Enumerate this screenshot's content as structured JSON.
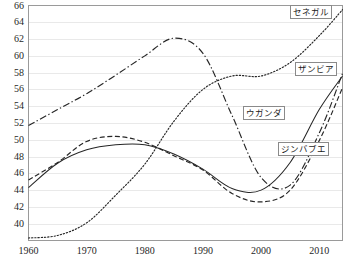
{
  "chart_data": {
    "type": "line",
    "title": "",
    "xlabel": "",
    "ylabel": "",
    "xlim": [
      1960,
      2014
    ],
    "ylim": [
      38,
      66
    ],
    "grid": true,
    "legend_position": "inline-labels",
    "xticks": [
      "1960",
      "1970",
      "1980",
      "1990",
      "2000",
      "2010"
    ],
    "xtick_values": [
      1960,
      1970,
      1980,
      1990,
      2000,
      2010
    ],
    "yticks": [
      "40",
      "42",
      "44",
      "46",
      "48",
      "50",
      "52",
      "54",
      "56",
      "58",
      "60",
      "62",
      "64",
      "66"
    ],
    "ytick_values": [
      40,
      42,
      44,
      46,
      48,
      50,
      52,
      54,
      56,
      58,
      60,
      62,
      64,
      66
    ],
    "x": [
      1960,
      1965,
      1970,
      1975,
      1980,
      1985,
      1990,
      1995,
      2000,
      2005,
      2010,
      2014
    ],
    "series": [
      {
        "name": "セネガル",
        "style": "dotted",
        "values": [
          38.3,
          38.6,
          40.1,
          43.4,
          47.1,
          52.2,
          56.0,
          57.6,
          57.6,
          59.2,
          62.4,
          65.5
        ],
        "label_x": 2008,
        "label_y": 65.3
      },
      {
        "name": "ザンビア",
        "style": "dash-dot",
        "values": [
          51.7,
          53.6,
          55.5,
          57.7,
          60.0,
          62.1,
          60.3,
          52.9,
          45.5,
          44.6,
          50.8,
          57.9
        ],
        "label_x": 2009,
        "label_y": 58.6
      },
      {
        "name": "ウガンダ",
        "style": "solid",
        "values": [
          44.3,
          47.2,
          48.8,
          49.4,
          49.4,
          48.3,
          46.5,
          44.2,
          44.0,
          47.3,
          53.6,
          57.6
        ],
        "label_x": 2000,
        "label_y": 53.3
      },
      {
        "name": "ジンバブエ",
        "style": "dashed",
        "values": [
          45.2,
          47.3,
          49.8,
          50.4,
          49.7,
          48.1,
          46.4,
          43.6,
          42.6,
          44.0,
          49.9,
          56.2
        ],
        "label_x": 2006,
        "label_y": 49.0
      }
    ]
  }
}
